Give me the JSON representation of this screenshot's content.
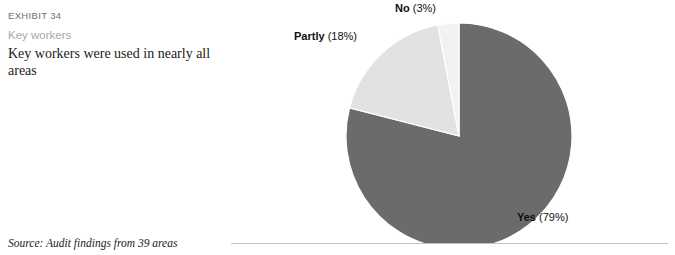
{
  "exhibit": {
    "number": "EXHIBIT 34",
    "subtitle": "Key workers",
    "title": "Key workers were used in nearly all areas",
    "source": "Source: Audit findings from 39 areas"
  },
  "colors": {
    "yes": "#6b6b6b",
    "partly": "#e2e2e2",
    "no": "#f2f2f2",
    "slice_stroke": "#ffffff",
    "rule": "#c2c2c2",
    "exhibit_number_text": "#6f6f6f",
    "subtitle_text": "#a8a8a8",
    "body_text": "#1b1b1b",
    "label_text": "#111111"
  },
  "chart_data": {
    "type": "pie",
    "title": "Key workers were used in nearly all areas",
    "categories": [
      "Yes",
      "Partly",
      "No"
    ],
    "values": [
      79,
      18,
      3
    ],
    "unit": "%",
    "start_angle_deg": 0,
    "direction": "clockwise",
    "legend": "none",
    "labels": [
      {
        "name": "Yes",
        "pct": "(79%)",
        "value": 79
      },
      {
        "name": "Partly",
        "pct": "(18%)",
        "value": 18
      },
      {
        "name": "No",
        "pct": "(3%)",
        "value": 3
      }
    ],
    "slice_colors": [
      "#6b6b6b",
      "#e2e2e2",
      "#f2f2f2"
    ],
    "source": "Source: Audit findings from 39 areas"
  }
}
